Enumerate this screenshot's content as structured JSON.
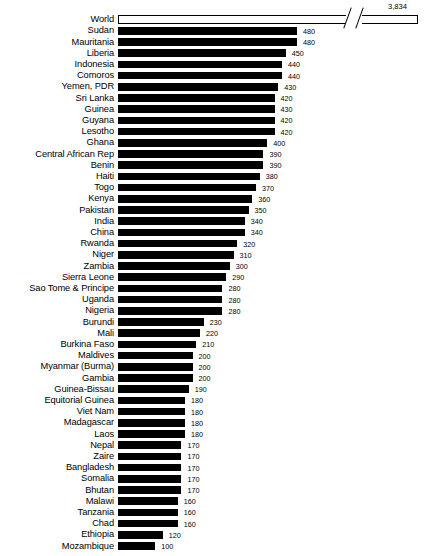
{
  "chart": {
    "type": "bar",
    "orientation": "horizontal",
    "title": "",
    "xlabel": "",
    "ylabel": "",
    "background_color": "#ffffff",
    "bar_color": "#000000",
    "highlight_bar_color": "#ffffff",
    "axis_break": {
      "present": true,
      "applies_to": "World",
      "note": "break-in-axis slashes on World bar"
    },
    "world_value_label": "3,834"
  },
  "chart_data": {
    "type": "bar",
    "title": "",
    "xlabel": "",
    "ylabel": "",
    "orientation": "horizontal",
    "grid": false,
    "legend": false,
    "axis_break": true,
    "categories": [
      "World",
      "Sudan",
      "Mauritania",
      "Liberia",
      "Indonesia",
      "Comoros",
      "Yemen, PDR",
      "Sri Lanka",
      "Guinea",
      "Guyana",
      "Lesotho",
      "Ghana",
      "Central African Rep",
      "Benin",
      "Haiti",
      "Togo",
      "Kenya",
      "Pakistan",
      "India",
      "China",
      "Rwanda",
      "Niger",
      "Zambia",
      "Sierra Leone",
      "Sao Tome & Principe",
      "Uganda",
      "Nigeria",
      "Burundi",
      "Mali",
      "Burkina Faso",
      "Maldives",
      "Myanmar (Burma)",
      "Gambia",
      "Guinea-Bissau",
      "Equitorial Guinea",
      "Viet Nam",
      "Madagascar",
      "Laos",
      "Nepal",
      "Zaire",
      "Bangladesh",
      "Somalia",
      "Bhutan",
      "Malawi",
      "Tanzania",
      "Chad",
      "Ethiopia",
      "Mozambique"
    ],
    "values": [
      3834,
      480,
      480,
      450,
      440,
      440,
      430,
      420,
      430,
      420,
      420,
      400,
      390,
      390,
      380,
      370,
      360,
      350,
      340,
      340,
      320,
      310,
      300,
      290,
      280,
      280,
      280,
      230,
      220,
      210,
      200,
      200,
      200,
      190,
      180,
      180,
      180,
      180,
      170,
      170,
      170,
      170,
      170,
      160,
      160,
      160,
      120,
      100
    ],
    "value_labels": [
      "3,834",
      "480",
      "480",
      "450",
      "440",
      "440",
      "430",
      "420",
      "430",
      "420",
      "420",
      "400",
      "390",
      "390",
      "380",
      "370",
      "360",
      "350",
      "340",
      "340",
      "320",
      "310",
      "300",
      "290",
      "280",
      "280",
      "280",
      "230",
      "220",
      "210",
      "200",
      "200",
      "200",
      "190",
      "180",
      "180",
      "180",
      "180",
      "170",
      "170",
      "170",
      "170",
      "170",
      "160",
      "160",
      "160",
      "120",
      "100"
    ],
    "xlim": [
      0,
      500
    ]
  }
}
